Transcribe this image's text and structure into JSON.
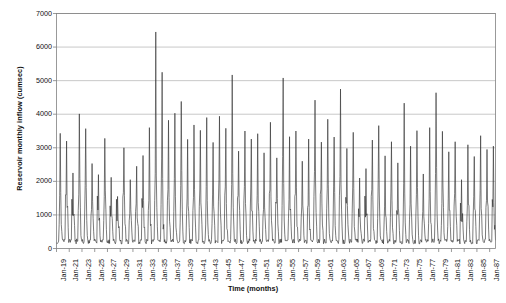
{
  "chart_data": {
    "type": "line",
    "title": "",
    "xlabel": "Time (months)",
    "ylabel": "Reservoir monthly inflow (cumsec)",
    "ylim": [
      0,
      7000
    ],
    "ytick_values": [
      0,
      1000,
      2000,
      3000,
      4000,
      5000,
      6000,
      7000
    ],
    "ytick_labels": [
      "0",
      "1000",
      "2000",
      "3000",
      "4000",
      "5000",
      "6000",
      "7000"
    ],
    "xlim": [
      "Jan-19",
      "Dec-87"
    ],
    "xtick_labels": [
      "Jan-19",
      "Jan-21",
      "Jan-23",
      "Jan-25",
      "Jan-27",
      "Jan-29",
      "Jan-31",
      "Jan-33",
      "Jan-35",
      "Jan-37",
      "Jan-39",
      "Jan-41",
      "Jan-43",
      "Jan-45",
      "Jan-47",
      "Jan-49",
      "Jan-51",
      "Jan-53",
      "Jan-55",
      "Jan-57",
      "Jan-59",
      "Jan-61",
      "Jan-63",
      "Jan-65",
      "Jan-67",
      "Jan-69",
      "Jan-71",
      "Jan-73",
      "Jan-75",
      "Jan-77",
      "Jan-79",
      "Jan-81",
      "Jan-83",
      "Jan-85",
      "Jan-87"
    ],
    "grid": true,
    "grid_axis": "y",
    "legend": false,
    "line_color": "#333333",
    "axis_color": "#808080",
    "grid_color": "#b0b0b0",
    "background": "#ffffff",
    "series": [
      {
        "name": "Reservoir monthly inflow",
        "units": "cumsec",
        "frequency": "monthly",
        "start": "Jan-19",
        "end": "Dec-87",
        "n_points": 828,
        "annual_peak_month_index": 7,
        "baseline_low": 180,
        "baseline_high": 700,
        "annual_peaks": [
          3430,
          3200,
          2250,
          4010,
          3570,
          2530,
          2200,
          3280,
          2120,
          1550,
          3000,
          2050,
          2450,
          2770,
          3600,
          6450,
          5250,
          3820,
          4030,
          4380,
          3250,
          3680,
          3520,
          3900,
          3160,
          3940,
          3580,
          5170,
          2900,
          3500,
          3260,
          3420,
          2850,
          3760,
          2700,
          5080,
          3330,
          3500,
          2600,
          3260,
          4420,
          3170,
          3850,
          3320,
          4750,
          2980,
          3460,
          2100,
          2380,
          3230,
          3660,
          2760,
          3180,
          2550,
          4330,
          3050,
          3510,
          2220,
          3600,
          4640,
          3490,
          2880,
          3180,
          2050,
          3090,
          2740,
          3360,
          2950,
          3050
        ],
        "secondary_peaks": [
          2100,
          1950,
          1400,
          2600,
          2200,
          1600,
          1380,
          2050,
          1300,
          1050,
          1850,
          1300,
          1500,
          1700,
          2250,
          3300,
          3100,
          2400,
          2500,
          2700,
          2000,
          2250,
          2150,
          2400,
          1950,
          2400,
          2200,
          3050,
          1800,
          2150,
          2000,
          2100,
          1750,
          2300,
          1700,
          3000,
          2050,
          2150,
          1600,
          2000,
          2700,
          1950,
          2350,
          2050,
          2900,
          1850,
          2150,
          1300,
          1480,
          2000,
          2250,
          1700,
          1950,
          1580,
          2650,
          1900,
          2150,
          1380,
          2200,
          2850,
          2150,
          1780,
          1950,
          1280,
          1900,
          1700,
          2060,
          1820,
          1880
        ],
        "max_value": 6450,
        "max_year_label": "Jan-35",
        "min_value": 120
      }
    ]
  }
}
